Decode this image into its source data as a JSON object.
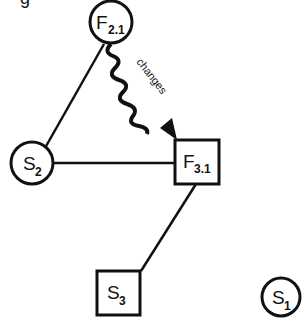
{
  "diagram": {
    "top_fragment": "g",
    "nodes": [
      {
        "id": "F2.1",
        "shape": "circle",
        "main": "F",
        "sub": "2.1"
      },
      {
        "id": "F3.1",
        "shape": "square",
        "main": "F",
        "sub": "3.1"
      },
      {
        "id": "S2",
        "shape": "circle",
        "main": "S",
        "sub": "2"
      },
      {
        "id": "S3",
        "shape": "square",
        "main": "S",
        "sub": "3"
      },
      {
        "id": "S1",
        "shape": "circle",
        "main": "S",
        "sub": "1"
      }
    ],
    "edges": [
      {
        "from": "F2.1",
        "to": "S2",
        "style": "straight"
      },
      {
        "from": "S2",
        "to": "F3.1",
        "style": "straight"
      },
      {
        "from": "F3.1",
        "to": "S3",
        "style": "straight"
      },
      {
        "from": "F2.1",
        "to": "F3.1",
        "style": "wavy-arrow",
        "label": "changes"
      }
    ],
    "colors": {
      "stroke": "#111111",
      "background": "#ffffff"
    }
  }
}
